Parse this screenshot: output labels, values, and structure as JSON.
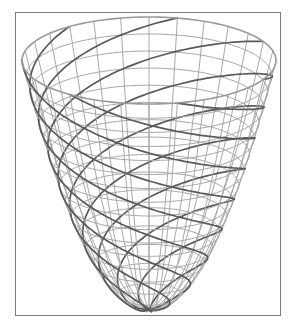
{
  "figure": {
    "kind": "paraboloid-wireframe",
    "frame": {
      "left": 15,
      "top": 12,
      "width": 266,
      "height": 304,
      "color": "#7a7a7a"
    },
    "surface": {
      "vertex": [
        149,
        310
      ],
      "rim_center_y": 60.5,
      "rim_rx": 127,
      "rim_ry": 43.5,
      "rings": 16,
      "meridians": 28,
      "mesh_color": "#a8a8a8",
      "mesh_width": 1,
      "rim_color": "#9a9a9a",
      "rim_width": 1.6
    },
    "spirals": {
      "count": 7,
      "turns": 1.15,
      "color": "#5a5a5a",
      "width": 1.7,
      "phase_offset": 0.4
    }
  }
}
